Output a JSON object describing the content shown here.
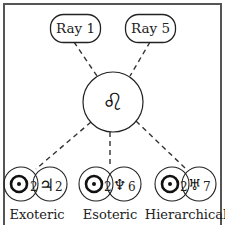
{
  "diagram": {
    "rays": [
      {
        "label": "Ray 1"
      },
      {
        "label": "Ray 5"
      }
    ],
    "center": {
      "sign": "leo",
      "glyph": "♌"
    },
    "rulers": [
      {
        "label": "Exoteric",
        "sun_house": "2",
        "planet": "jupiter",
        "planet_glyph": "♃",
        "planet_house": "2"
      },
      {
        "label": "Esoteric",
        "sun_house": "2",
        "planet": "neptune",
        "planet_glyph": "♆",
        "planet_house": "6"
      },
      {
        "label": "Hierarchical",
        "sun_house": "2",
        "planet": "uranus",
        "planet_glyph": "♅",
        "planet_house": "7"
      }
    ],
    "colors": {
      "line": "#222222",
      "frame": "#555555",
      "background": "#ffffff"
    }
  }
}
